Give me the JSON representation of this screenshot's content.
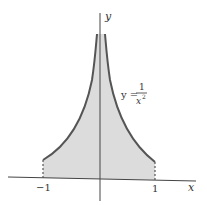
{
  "diagram": {
    "function_label": {
      "lhs": "y =",
      "numerator": "1",
      "denominator": "x",
      "exponent": "2"
    },
    "axes": {
      "x_label": "x",
      "y_label": "y"
    },
    "ticks": {
      "left": "−1",
      "right": "1"
    },
    "colors": {
      "fill": "#dcdcdc",
      "curve": "#555555",
      "axis": "#444444"
    }
  }
}
